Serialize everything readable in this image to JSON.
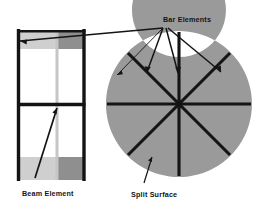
{
  "figure": {
    "width": 261,
    "height": 209,
    "background": "#ffffff"
  },
  "labels": {
    "bar_elements": "Bar Elements",
    "beam_element": "Beam Element",
    "split_surface": "Split Surface"
  },
  "colors": {
    "line": "#141414",
    "text": "#141414",
    "background": "#ffffff",
    "shade_light": "#cfcfcf",
    "shade_medium": "#d9d9d9",
    "shade_dark": "#8f8f8f",
    "annulus_gray": "#9a9a9a",
    "thin_gray": "#c6c6c6"
  },
  "frame_model": {
    "name": "planar-frame",
    "left_column_x": 17,
    "right_column_x": 84,
    "mid_column_x": 57,
    "top_beam_y": 31,
    "mid_beam_y": 104,
    "bottom_y": 180,
    "stories": 2,
    "bays": 1,
    "shade_bands": [
      {
        "region": "top-left",
        "x": 17,
        "y": 31,
        "w": 40,
        "h": 18,
        "color": "#cfcfcf"
      },
      {
        "region": "top-right",
        "x": 57,
        "y": 31,
        "w": 27,
        "h": 18,
        "color": "#8f8f8f"
      },
      {
        "region": "bottom-left",
        "x": 17,
        "y": 157,
        "w": 40,
        "h": 23,
        "color": "#cfcfcf"
      },
      {
        "region": "bottom-right",
        "x": 57,
        "y": 157,
        "w": 27,
        "h": 23,
        "color": "#8f8f8f"
      }
    ]
  },
  "circular_model": {
    "name": "split-surface-disc",
    "center_x": 179,
    "center_y": 104,
    "outer_radius": 73,
    "inner_radius": 47,
    "annulus_color": "#9a9a9a",
    "spoke_count": 8,
    "spoke_angles_deg": [
      0,
      45,
      90,
      135,
      180,
      225,
      270,
      315
    ],
    "spoke_inner_radius": 0,
    "spoke_outer_radius": 72
  },
  "leader_lines": {
    "bar_elements_anchor": {
      "x": 163,
      "y": 27
    },
    "targets": [
      {
        "to_x": 19,
        "to_y": 41,
        "desc": "frame-top-left-beam"
      },
      {
        "to_x": 118,
        "to_y": 74,
        "desc": "annulus-upper-left-spoke"
      },
      {
        "to_x": 148,
        "to_y": 71,
        "desc": "disc-diagonal-spoke"
      },
      {
        "to_x": 179,
        "to_y": 74,
        "desc": "disc-vertical-spoke"
      },
      {
        "to_x": 222,
        "to_y": 72,
        "desc": "disc-upper-right-spoke"
      }
    ],
    "beam_elements_anchor": {
      "x": 62,
      "y": 183
    },
    "beam_target": {
      "to_x": 56,
      "to_y": 108
    },
    "split_surface_anchor": {
      "x": 156,
      "y": 186
    },
    "split_surface_target": {
      "to_x": 150,
      "to_y": 159
    }
  }
}
